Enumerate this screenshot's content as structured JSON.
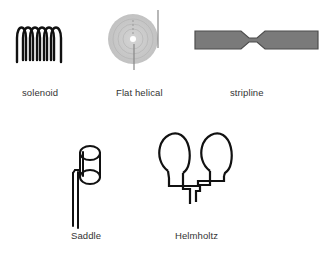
{
  "diagram": {
    "items": [
      {
        "id": "solenoid",
        "label": "solenoid"
      },
      {
        "id": "flat-helical",
        "label": "Flat helical"
      },
      {
        "id": "stripline",
        "label": "stripline"
      },
      {
        "id": "saddle",
        "label": "Saddle"
      },
      {
        "id": "helmholtz",
        "label": "Helmholtz"
      }
    ],
    "colors": {
      "stroke": "#111111",
      "disc_fill": "#c8c8c8",
      "stripline_fill": "#7a7a7a",
      "stripline_border": "#4d4d4d",
      "label": "#333333"
    }
  }
}
